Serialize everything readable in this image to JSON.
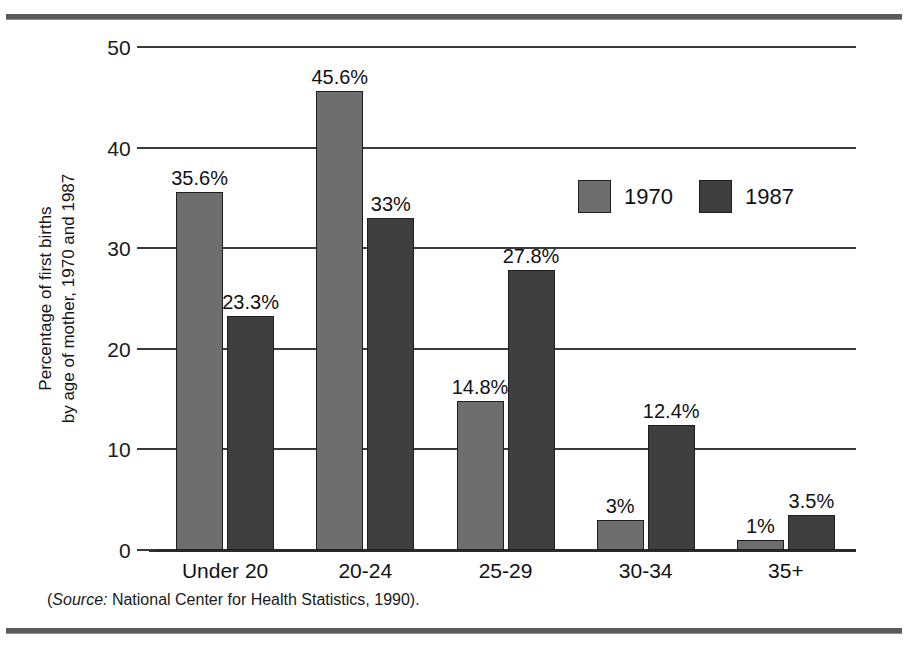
{
  "figure": {
    "source_note_prefix": "(",
    "source_word": "Source:",
    "source_text": " National Center for Health Statistics, 1990).",
    "colors": {
      "series_1970": "#6e6e6e",
      "series_1987": "#3f3f3f",
      "axis": "#2a2a2a",
      "rule": "#5a5a5a",
      "background": "#ffffff"
    }
  },
  "chart_data": {
    "type": "bar",
    "title": "",
    "xlabel": "",
    "ylabel": "Percentage of first births by age of mother, 1970 and 1987",
    "ylabel_line1": "Percentage of first births",
    "ylabel_line2": "by age of mother, 1970 and 1987",
    "categories": [
      "Under 20",
      "20-24",
      "25-29",
      "30-34",
      "35+"
    ],
    "series": [
      {
        "name": "1970",
        "color": "#6e6e6e",
        "values": [
          35.6,
          45.6,
          14.8,
          3,
          1
        ],
        "labels": [
          "35.6%",
          "45.6%",
          "14.8%",
          "3%",
          "1%"
        ]
      },
      {
        "name": "1987",
        "color": "#3f3f3f",
        "values": [
          23.3,
          33,
          27.8,
          12.4,
          3.5
        ],
        "labels": [
          "23.3%",
          "33%",
          "27.8%",
          "12.4%",
          "3.5%"
        ]
      }
    ],
    "ylim": [
      0,
      50
    ],
    "yticks": [
      0,
      10,
      20,
      30,
      40,
      50
    ],
    "ytick_labels": [
      "0",
      "10",
      "20",
      "30",
      "40",
      "50"
    ],
    "grid": true,
    "grid_axis": "y",
    "legend_position": "inside-upper-right",
    "legend_entries": [
      "1970",
      "1987"
    ]
  }
}
